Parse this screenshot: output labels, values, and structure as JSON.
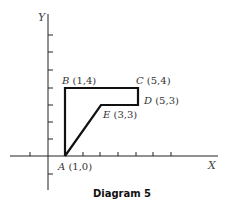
{
  "caption": "Diagram 5",
  "axes": {
    "x_label": "X",
    "y_label": "Y"
  },
  "points": [
    {
      "name": "A",
      "coords": "(1,0)",
      "x": 1,
      "y": 0
    },
    {
      "name": "B",
      "coords": "(1,4)",
      "x": 1,
      "y": 4
    },
    {
      "name": "C",
      "coords": "(5,4)",
      "x": 5,
      "y": 4
    },
    {
      "name": "D",
      "coords": "(5,3)",
      "x": 5,
      "y": 3
    },
    {
      "name": "E",
      "coords": "(3,3)",
      "x": 3,
      "y": 3
    }
  ],
  "polygon": [
    "A",
    "B",
    "C",
    "D",
    "E",
    "A"
  ],
  "colors": {
    "line": "#111111",
    "text": "#333333"
  }
}
